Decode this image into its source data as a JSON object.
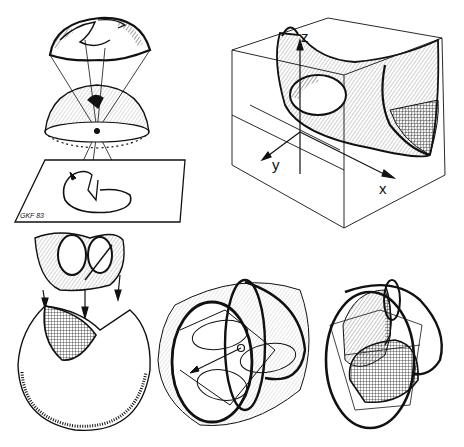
{
  "plate": {
    "background": "#ffffff",
    "ink_color": "#111111",
    "figures": [
      {
        "id": "projection-stack",
        "description": "Hemispherical surface projected through a sphere center onto a plane",
        "signature": "GKF 83"
      },
      {
        "id": "surface-in-box",
        "description": "Saddle-like surface inside a wireframe box with coordinate axes",
        "axes": {
          "z": "z",
          "y": "y",
          "x": "x"
        }
      },
      {
        "id": "cut-disk",
        "description": "Folded surface above a disk with a wedge cut and a cross-hatched cap"
      },
      {
        "id": "cylinder-lobes",
        "description": "Cylinder with bold circular rings and inscribed lobed curves"
      },
      {
        "id": "shaded-ovoid",
        "description": "Hatched ovoid surface intersected by planes and bold loops"
      }
    ]
  }
}
